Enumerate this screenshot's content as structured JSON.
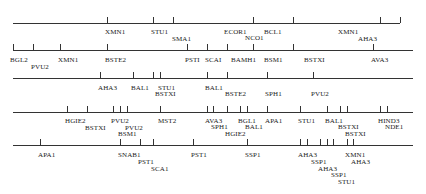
{
  "diagram": {
    "type": "restriction-map",
    "line_color": "#333333",
    "text_color": "#222222",
    "tracks": [
      {
        "id": "track-1",
        "y": 23,
        "x1": 13,
        "x2": 400,
        "ticks": [
          107,
          153,
          173,
          253,
          293,
          380,
          400
        ],
        "labels": [
          {
            "text": "XMN1",
            "x": 107,
            "y": 29
          },
          {
            "text": "STU1",
            "x": 153,
            "y": 29
          },
          {
            "text": "SMA1",
            "x": 174,
            "y": 36
          },
          {
            "text": "ECOR1",
            "x": 226,
            "y": 29
          },
          {
            "text": "NCO1",
            "x": 247,
            "y": 35
          },
          {
            "text": "BCL1",
            "x": 266,
            "y": 29
          },
          {
            "text": "XMN1",
            "x": 340,
            "y": 29
          },
          {
            "text": "AHA3",
            "x": 360,
            "y": 36
          }
        ]
      },
      {
        "id": "track-2",
        "y": 50,
        "x1": 13,
        "x2": 413,
        "ticks": [
          13,
          33,
          60,
          107,
          187,
          207,
          227,
          253,
          293,
          373
        ],
        "labels": [
          {
            "text": "BGL2",
            "x": 12,
            "y": 57
          },
          {
            "text": "PVU2",
            "x": 33,
            "y": 64
          },
          {
            "text": "XMN1",
            "x": 60,
            "y": 57
          },
          {
            "text": "BSTE2",
            "x": 107,
            "y": 57
          },
          {
            "text": "PSTI",
            "x": 187,
            "y": 57
          },
          {
            "text": "SCAI",
            "x": 207,
            "y": 57
          },
          {
            "text": "BAMH1",
            "x": 233,
            "y": 57
          },
          {
            "text": "BSM1",
            "x": 266,
            "y": 57
          },
          {
            "text": "BSTXI",
            "x": 306,
            "y": 57
          },
          {
            "text": "AVA3",
            "x": 373,
            "y": 57
          }
        ]
      },
      {
        "id": "track-3",
        "y": 78,
        "x1": 13,
        "x2": 413,
        "ticks": [
          100,
          133,
          153,
          160,
          207,
          227,
          267,
          313
        ],
        "labels": [
          {
            "text": "AHA3",
            "x": 100,
            "y": 85
          },
          {
            "text": "BAL1",
            "x": 133,
            "y": 85
          },
          {
            "text": "STU1",
            "x": 160,
            "y": 85
          },
          {
            "text": "BSTXI",
            "x": 157,
            "y": 91
          },
          {
            "text": "BAL1",
            "x": 207,
            "y": 85
          },
          {
            "text": "BSTE2",
            "x": 227,
            "y": 91
          },
          {
            "text": "SPH1",
            "x": 267,
            "y": 91
          },
          {
            "text": "PVU2",
            "x": 313,
            "y": 91
          }
        ]
      },
      {
        "id": "track-4",
        "y": 112,
        "x1": 13,
        "x2": 413,
        "ticks": [
          67,
          87,
          113,
          120,
          127,
          160,
          207,
          213,
          227,
          240,
          247,
          267,
          300,
          327,
          340,
          347,
          380,
          387
        ],
        "labels": [
          {
            "text": "HGIE2",
            "x": 67,
            "y": 118
          },
          {
            "text": "BSTXI",
            "x": 87,
            "y": 125
          },
          {
            "text": "PVU2",
            "x": 113,
            "y": 118
          },
          {
            "text": "PVU2",
            "x": 127,
            "y": 125
          },
          {
            "text": "BSM1",
            "x": 120,
            "y": 131
          },
          {
            "text": "MST2",
            "x": 160,
            "y": 118
          },
          {
            "text": "AVA3",
            "x": 207,
            "y": 118
          },
          {
            "text": "SPH1",
            "x": 213,
            "y": 124
          },
          {
            "text": "HGIE2",
            "x": 227,
            "y": 131
          },
          {
            "text": "BGL1",
            "x": 240,
            "y": 118
          },
          {
            "text": "BAL1",
            "x": 247,
            "y": 124
          },
          {
            "text": "APA1",
            "x": 267,
            "y": 118
          },
          {
            "text": "STU1",
            "x": 300,
            "y": 118
          },
          {
            "text": "BAL1",
            "x": 327,
            "y": 118
          },
          {
            "text": "BSTXI",
            "x": 340,
            "y": 124
          },
          {
            "text": "BSTXI",
            "x": 347,
            "y": 131
          },
          {
            "text": "HIND3",
            "x": 380,
            "y": 118
          },
          {
            "text": "NDE1",
            "x": 387,
            "y": 124
          }
        ]
      },
      {
        "id": "track-5",
        "y": 145,
        "x1": 13,
        "x2": 413,
        "ticks": [
          40,
          120,
          140,
          153,
          193,
          247,
          300,
          307,
          320,
          327,
          333,
          347,
          353
        ],
        "labels": [
          {
            "text": "APA1",
            "x": 40,
            "y": 152
          },
          {
            "text": "SNAB1",
            "x": 120,
            "y": 152
          },
          {
            "text": "PST1",
            "x": 140,
            "y": 159
          },
          {
            "text": "SCA1",
            "x": 153,
            "y": 166
          },
          {
            "text": "PST1",
            "x": 193,
            "y": 152
          },
          {
            "text": "SSP1",
            "x": 247,
            "y": 152
          },
          {
            "text": "AHA3",
            "x": 300,
            "y": 152
          },
          {
            "text": "SSP1",
            "x": 313,
            "y": 159
          },
          {
            "text": "AHA3",
            "x": 320,
            "y": 166
          },
          {
            "text": "SSP1",
            "x": 333,
            "y": 172
          },
          {
            "text": "STU1",
            "x": 340,
            "y": 179
          },
          {
            "text": "XMN1",
            "x": 347,
            "y": 152
          },
          {
            "text": "AHA3",
            "x": 353,
            "y": 159
          }
        ]
      }
    ]
  }
}
